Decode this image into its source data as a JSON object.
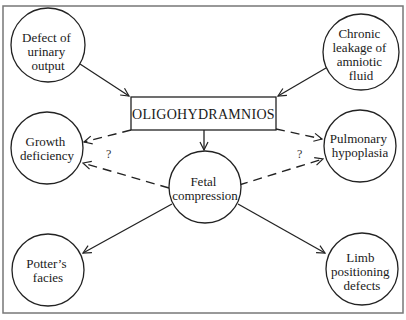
{
  "diagram": {
    "central": {
      "label": "OLIGOHYDRAMNIOS"
    },
    "nodes": [
      {
        "id": "defect",
        "lines": [
          "Defect of",
          "urinary",
          "output"
        ]
      },
      {
        "id": "chronic",
        "lines": [
          "Chronic",
          "leakage of",
          "amniotic",
          "fluid"
        ]
      },
      {
        "id": "growth",
        "lines": [
          "Growth",
          "deficiency"
        ]
      },
      {
        "id": "pulmonary",
        "lines": [
          "Pulmonary",
          "hypoplasia"
        ]
      },
      {
        "id": "fetal",
        "lines": [
          "Fetal",
          "compression"
        ]
      },
      {
        "id": "potter",
        "lines": [
          "Potter’s",
          "facies"
        ]
      },
      {
        "id": "limb",
        "lines": [
          "Limb",
          "positioning",
          "defects"
        ]
      }
    ],
    "edges": [
      {
        "from": "defect",
        "to": "OLIGOHYDRAMNIOS",
        "style": "solid"
      },
      {
        "from": "chronic",
        "to": "OLIGOHYDRAMNIOS",
        "style": "solid"
      },
      {
        "from": "OLIGOHYDRAMNIOS",
        "to": "fetal",
        "style": "solid"
      },
      {
        "from": "OLIGOHYDRAMNIOS",
        "to": "growth",
        "style": "dashed",
        "label": "?"
      },
      {
        "from": "OLIGOHYDRAMNIOS",
        "to": "pulmonary",
        "style": "dashed",
        "label": "?"
      },
      {
        "from": "fetal",
        "to": "growth",
        "style": "dashed"
      },
      {
        "from": "fetal",
        "to": "pulmonary",
        "style": "dashed"
      },
      {
        "from": "fetal",
        "to": "potter",
        "style": "solid"
      },
      {
        "from": "fetal",
        "to": "limb",
        "style": "solid"
      }
    ],
    "uncertain_marker": "?"
  }
}
